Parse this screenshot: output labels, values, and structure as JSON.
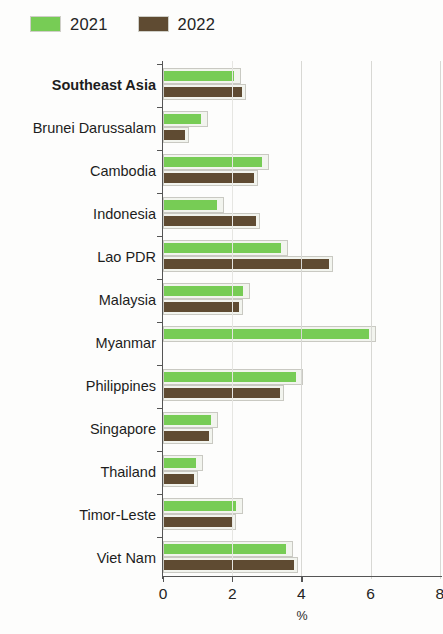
{
  "legend": {
    "position": "top-left",
    "entries": [
      {
        "label": "2021",
        "color": "#77cc55"
      },
      {
        "label": "2022",
        "color": "#5f4b32"
      }
    ]
  },
  "axis": {
    "ticks": [
      "0",
      "2",
      "4",
      "6",
      "8"
    ],
    "title": "%"
  },
  "chart_data": {
    "type": "bar",
    "orientation": "horizontal",
    "title": "",
    "subtitle": "",
    "xlabel": "%",
    "ylabel": "",
    "xlim": [
      0,
      8
    ],
    "xticks": [
      0,
      2,
      4,
      6,
      8
    ],
    "grid": "vertical",
    "legend_position": "top-left",
    "categories": [
      "Southeast Asia",
      "Brunei Darussalam",
      "Cambodia",
      "Indonesia",
      "Lao PDR",
      "Malaysia",
      "Myanmar",
      "Philippines",
      "Singapore",
      "Thailand",
      "Timor-Leste",
      "Viet Nam"
    ],
    "emphasized_categories": [
      "Southeast Asia"
    ],
    "series": [
      {
        "name": "2021",
        "color": "#77cc55",
        "values": [
          2.25,
          1.3,
          3.05,
          1.75,
          3.6,
          2.5,
          6.15,
          4.05,
          1.6,
          1.15,
          2.3,
          3.75
        ]
      },
      {
        "name": "2022",
        "color": "#5f4b32",
        "values": [
          2.4,
          0.75,
          2.75,
          2.8,
          4.9,
          2.3,
          null,
          3.5,
          1.45,
          1.0,
          2.1,
          3.9
        ]
      }
    ]
  }
}
